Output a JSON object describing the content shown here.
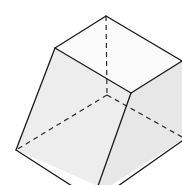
{
  "diagram": {
    "title": "",
    "type": "3D solid (frustum / truncated pyramid) line drawing",
    "colors": {
      "background": "#ffffff",
      "top_face": "#fbfbfb",
      "front_face": "#ededed",
      "right_face": "#e7e7e7",
      "edge": "#1a1a1a",
      "hidden_edge": "#2a2a2a"
    },
    "vertices": {
      "top_back": [
        106,
        16
      ],
      "top_left": [
        55,
        48
      ],
      "top_front": [
        131,
        93
      ],
      "top_right": [
        182,
        61
      ],
      "hidden_center": [
        107,
        95
      ],
      "bottom_left": [
        16,
        150
      ],
      "bottom_front": [
        98,
        186
      ],
      "right_bottom": [
        182,
        140
      ],
      "right_dashed_end": [
        182,
        137
      ]
    },
    "faces": [
      {
        "name": "top-face",
        "points": "106,16 55,48 131,93 182,61"
      },
      {
        "name": "front-face",
        "points": "55,48 16,150 98,186 131,93"
      },
      {
        "name": "right-face",
        "points": "131,93 182,61 182,140 110,186 98,186"
      }
    ],
    "visible_edges": [
      {
        "name": "top-back-left",
        "d": "M106,16 L55,48"
      },
      {
        "name": "top-back-right",
        "d": "M106,16 L182,61"
      },
      {
        "name": "top-left-front",
        "d": "M55,48 L131,93"
      },
      {
        "name": "top-front-right",
        "d": "M131,93 L182,61"
      },
      {
        "name": "left-slant",
        "d": "M55,48 L16,150"
      },
      {
        "name": "front-slant",
        "d": "M131,93 L98,186"
      },
      {
        "name": "bottom-left-front",
        "d": "M16,150 L72,186"
      },
      {
        "name": "bottom-right",
        "d": "M118,186 L182,141"
      }
    ],
    "hidden_edges": [
      {
        "name": "hidden-vertical",
        "d": "M106,16 L107,95"
      },
      {
        "name": "hidden-left",
        "d": "M107,95 L16,150"
      },
      {
        "name": "hidden-right",
        "d": "M107,95 L182,137"
      }
    ]
  }
}
